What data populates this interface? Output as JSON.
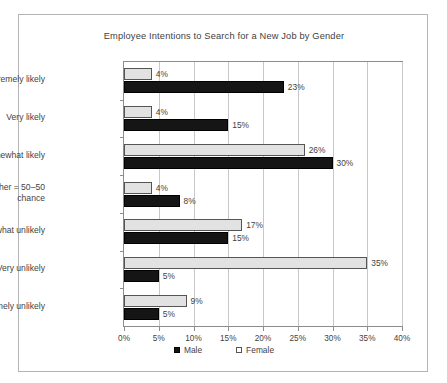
{
  "chart_data": {
    "type": "bar",
    "orientation": "horizontal",
    "title": "Employee Intentions to Search for a New Job by Gender",
    "xlabel": "",
    "ylabel": "",
    "xlim": [
      0,
      40
    ],
    "xtick_labels": [
      "0%",
      "5%",
      "10%",
      "15%",
      "20%",
      "25%",
      "30%",
      "35%",
      "40%"
    ],
    "xticks": [
      0,
      5,
      10,
      15,
      20,
      25,
      30,
      35,
      40
    ],
    "grid": true,
    "legend_position": "bottom",
    "categories": [
      "Extremely likely",
      "Very likely",
      "Somewhat likely",
      "Neither = 50–50\nchance",
      "Somewhat unlikely",
      "Very unlikely",
      "Extremely unlikely"
    ],
    "series": [
      {
        "name": "Male",
        "color": "#151515",
        "values": [
          23,
          15,
          30,
          8,
          15,
          5,
          5
        ],
        "labels": [
          "23%",
          "15%",
          "30%",
          "8%",
          "15%",
          "5%",
          "5%"
        ]
      },
      {
        "name": "Female",
        "color": "#e2e2e2",
        "values": [
          4,
          4,
          26,
          4,
          17,
          35,
          9
        ],
        "labels": [
          "4%",
          "4%",
          "26%",
          "4%",
          "17%",
          "35%",
          "9%"
        ]
      }
    ]
  },
  "legend": {
    "entries": [
      {
        "label": "Male"
      },
      {
        "label": "Female"
      }
    ]
  }
}
